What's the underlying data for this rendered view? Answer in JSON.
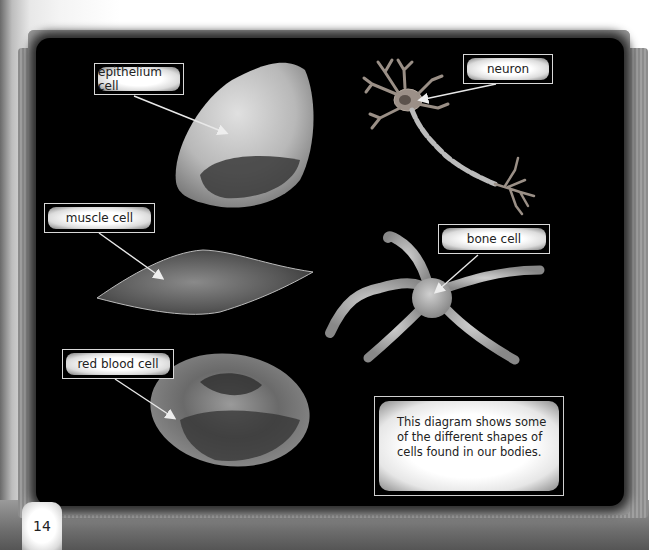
{
  "diagram": {
    "labels": {
      "epithelium": "epithelium cell",
      "neuron": "neuron",
      "muscle": "muscle cell",
      "bone": "bone cell",
      "red_blood": "red blood cell"
    },
    "caption": "This diagram shows some of the different shapes of cells found in our bodies.",
    "page_number": "14"
  },
  "colors": {
    "board": "#000000",
    "label_border": "#d8d8d8",
    "text": "#222222"
  }
}
